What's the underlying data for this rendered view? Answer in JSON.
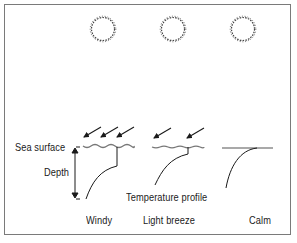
{
  "diagram": {
    "type": "ocean surface temperature profiles under wind conditions",
    "labels": {
      "sea_surface": "Sea surface",
      "depth": "Depth",
      "temperature_profile": "Temperature profile"
    },
    "panels": [
      {
        "name": "Windy",
        "wind_arrows": 3,
        "surface": "wavy",
        "mixed_layer": "deep"
      },
      {
        "name": "Light breeze",
        "wind_arrows": 2,
        "surface": "slightly wavy",
        "mixed_layer": "shallow"
      },
      {
        "name": "Calm",
        "wind_arrows": 0,
        "surface": "flat",
        "mixed_layer": "none"
      }
    ],
    "icons": [
      "sun-icon",
      "sun-icon",
      "sun-icon",
      "wind-arrow-icon"
    ],
    "colors": {
      "line": "#1a1a1a",
      "wave": "#777777",
      "frame": "#7a7a7a",
      "background": "#ffffff"
    }
  }
}
